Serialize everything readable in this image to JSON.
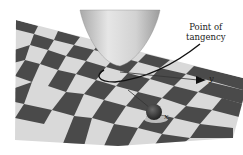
{
  "figure": {
    "annotation": {
      "line1": "Point of",
      "line2": "tangency"
    },
    "axes": {
      "y_label": "y",
      "x_label": "x"
    },
    "colors": {
      "checker_dark": "#4a4a4a",
      "checker_light": "#d9d9d9",
      "paraboloid": "#cfcfcf",
      "curve": "#111111",
      "sphere": "#2e2e2e"
    }
  }
}
